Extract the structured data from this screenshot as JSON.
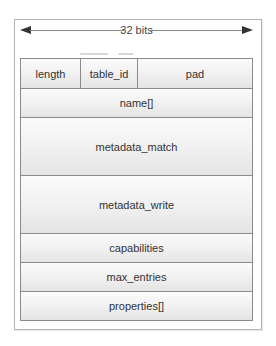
{
  "diagram": {
    "width_label": "32 bits",
    "rows": [
      {
        "height_units": 1,
        "fields": [
          {
            "label": "length"
          },
          {
            "label": "table_id"
          },
          {
            "label": "pad"
          }
        ]
      },
      {
        "height_units": 1,
        "fields": [
          {
            "label": "name[]"
          }
        ]
      },
      {
        "height_units": 2,
        "fields": [
          {
            "label": "metadata_match"
          }
        ]
      },
      {
        "height_units": 2,
        "fields": [
          {
            "label": "metadata_write"
          }
        ]
      },
      {
        "height_units": 1,
        "fields": [
          {
            "label": "capabilities"
          }
        ]
      },
      {
        "height_units": 1,
        "fields": [
          {
            "label": "max_entries"
          }
        ]
      },
      {
        "height_units": 1,
        "fields": [
          {
            "label": "properties[]"
          }
        ]
      }
    ]
  },
  "colors": {
    "border": "#8a8a8a",
    "cell_top": "#fbfbfb",
    "cell_bottom": "#e4e4e4",
    "text": "#333333",
    "arrow": "#333333"
  }
}
